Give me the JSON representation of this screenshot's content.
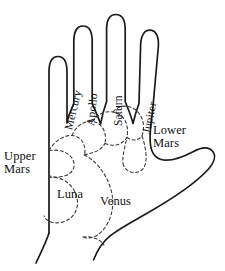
{
  "diagram": {
    "colors": {
      "background": "#ffffff",
      "outline": "#1a1a1a",
      "mount_boundary": "#3a3a3a",
      "text": "#111111"
    },
    "line_styles": {
      "hand_outline": "solid",
      "mount_boundary": "dashed"
    }
  },
  "finger_labels": [
    {
      "id": "mercury",
      "label": "Mercury",
      "finger": "little",
      "rotation_deg": -76,
      "x": 62,
      "y": 126
    },
    {
      "id": "apollo",
      "label": "Apollo",
      "finger": "ring",
      "rotation_deg": -84,
      "x": 83,
      "y": 123
    },
    {
      "id": "saturn",
      "label": "Saturn",
      "finger": "middle",
      "rotation_deg": -90,
      "x": 110,
      "y": 124
    },
    {
      "id": "jupiter",
      "label": "Jupiter",
      "finger": "index",
      "rotation_deg": -78,
      "x": 138,
      "y": 130
    }
  ],
  "mount_labels": [
    {
      "id": "upper-mars",
      "label": "Upper\nMars",
      "x": 3,
      "y": 152,
      "align": "left"
    },
    {
      "id": "lower-mars",
      "label": "Lower\nMars",
      "x": 152,
      "y": 126,
      "align": "left"
    },
    {
      "id": "luna",
      "label": "Luna",
      "x": 57,
      "y": 189,
      "align": "left"
    },
    {
      "id": "venus",
      "label": "Venus",
      "x": 101,
      "y": 196,
      "align": "left"
    }
  ],
  "paths": {
    "hand_outline": "M 49,232 C 49,200 49,172 49,150 C 49,136 49,128 49,120 L 49,72 C 49,62 53,57 58,57 C 63,57 67,62 67,72 L 67,124 M 67,124 C 69,115 72,110 74,104 L 74,42 C 74,32 78,27 83,27 C 89,27 93,32 93,42 L 93,104 M 93,104 C 95,110 98,115 101,124 M 101,124 C 103,114 105,108 107,102 L 107,30 C 107,20 111,16 116,16 C 122,16 126,20 126,30 L 126,102 C 128,108 131,114 133,124 M 133,124 C 135,116 137,110 139,104 L 140,46 C 140,36 144,31 149,31 C 155,31 159,36 158,46 L 152,112 C 150,124 149,134 149,142 C 149,152 152,158 158,160 C 168,163 182,157 192,152 C 201,147 208,147 212,151 C 216,155 215,162 208,170 C 196,183 170,200 148,213 C 131,223 119,229 110,236 C 103,241 98,248 94,258 M 49,232 C 46,240 41,251 36,262",
    "wrist_left": "M 49,232 C 46,240 41,251 36,262",
    "mount_upper_mars": "M 49,152 C 60,150 70,153 73,160 C 76,167 72,174 63,176 C 55,178 49,175 49,172",
    "mount_luna": "M 49,178 C 60,176 72,182 76,194 C 80,206 74,218 63,221 C 54,223 47,220 45,215",
    "mount_venus": "M 86,152 C 96,158 104,170 108,184 C 112,198 110,212 104,222 C 98,232 90,236 84,234",
    "mount_mercury": "M 49,150 C 56,141 66,136 74,137 C 82,138 86,145 86,152",
    "mount_apollo": "M 74,137 C 78,128 86,123 94,124 C 102,125 106,131 106,139",
    "mount_saturn": "M 106,139 C 108,130 116,125 124,126 C 132,127 136,133 136,141",
    "mount_jupiter": "M 136,141 C 138,132 144,128 149,129",
    "mount_lower_mars": "M 136,141 C 140,150 142,158 142,165 C 142,172 140,176 136,178",
    "mount_divider_lower": "M 86,152 C 92,150 100,150 106,152",
    "palm_base_curve": "M 84,234 C 92,232 100,234 104,240"
  }
}
